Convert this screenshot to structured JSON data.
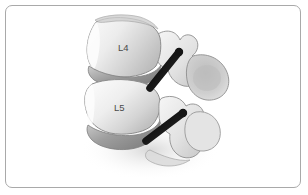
{
  "figure": {
    "kind": "medical-illustration",
    "view": "lateral oblique view of lumbar spine",
    "background_color": "#ffffff",
    "border_color": "#a9a9a9",
    "bone_light": "#f2f2f2",
    "bone_mid": "#d8d8d8",
    "bone_shadow": "#b0b0b0",
    "outline_color": "#8c8c8c",
    "disc_color": "#9b9b9b",
    "instrument_color": "#1a1a1a",
    "label_color": "#4a4a4a"
  },
  "labels": {
    "vertebra_upper": "L4",
    "vertebra_lower": "L5"
  },
  "structures": [
    {
      "name": "vertebral-body-l4",
      "label": "L4"
    },
    {
      "name": "vertebral-body-l5",
      "label": "L5"
    },
    {
      "name": "intervertebral-disc-l3-l4",
      "label": ""
    },
    {
      "name": "intervertebral-disc-l4-l5",
      "label": ""
    },
    {
      "name": "intervertebral-disc-l5-s1",
      "label": ""
    },
    {
      "name": "posterior-elements-upper",
      "label": ""
    },
    {
      "name": "posterior-elements-lower",
      "label": ""
    },
    {
      "name": "transverse-process-upper",
      "label": ""
    },
    {
      "name": "transverse-process-lower",
      "label": ""
    },
    {
      "name": "facet-joint",
      "label": ""
    }
  ],
  "instruments": [
    {
      "name": "pedicle-screw-upper",
      "label": ""
    },
    {
      "name": "pedicle-screw-lower",
      "label": ""
    }
  ]
}
